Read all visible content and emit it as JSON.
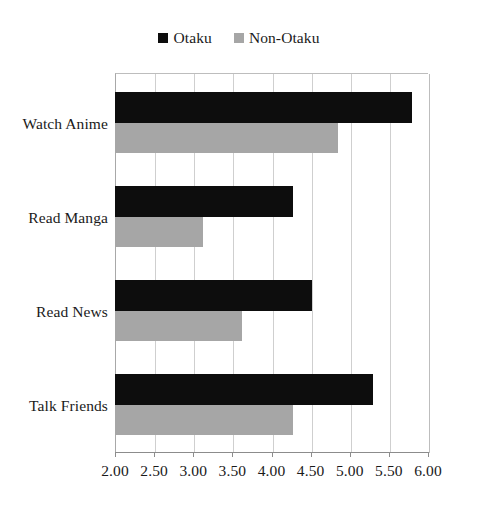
{
  "chart_data": {
    "type": "bar",
    "orientation": "horizontal",
    "title": "",
    "subtitle": "",
    "xlabel": "",
    "ylabel": "",
    "categories": [
      "Watch Anime",
      "Read Manga",
      "Read News",
      "Talk Friends"
    ],
    "series": [
      {
        "name": "Otaku",
        "color": "#0d0d0d",
        "values": [
          5.8,
          4.28,
          4.52,
          5.3
        ]
      },
      {
        "name": "Non-Otaku",
        "color": "#a6a6a6",
        "values": [
          4.85,
          3.12,
          3.62,
          4.28
        ]
      }
    ],
    "xlim": [
      2.0,
      6.0
    ],
    "xticks": [
      2.0,
      2.5,
      3.0,
      3.5,
      4.0,
      4.5,
      5.0,
      5.5,
      6.0
    ],
    "xtick_labels": [
      "2.00",
      "2.50",
      "3.00",
      "3.50",
      "4.00",
      "4.50",
      "5.00",
      "5.50",
      "6.00"
    ],
    "grid": "vertical",
    "legend_position": "top-center",
    "legend_entries": [
      "Otaku",
      "Non-Otaku"
    ],
    "annotations": []
  },
  "legend": {
    "items": [
      {
        "label": "Otaku",
        "swatch_color": "#0d0d0d",
        "icon": "square-marker-icon"
      },
      {
        "label": "Non-Otaku",
        "swatch_color": "#a6a6a6",
        "icon": "square-marker-icon"
      }
    ]
  },
  "axis": {
    "tick_labels": [
      "2.00",
      "2.50",
      "3.00",
      "3.50",
      "4.00",
      "4.50",
      "5.00",
      "5.50",
      "6.00"
    ]
  },
  "categories": {
    "labels": [
      "Watch Anime",
      "Read Manga",
      "Read News",
      "Talk Friends"
    ]
  },
  "colors": {
    "otaku": "#0d0d0d",
    "non_otaku": "#a6a6a6",
    "gridline": "#cfcfcf",
    "axis": "#8c8c8c",
    "background": "#ffffff",
    "text": "#1a1a1a"
  }
}
